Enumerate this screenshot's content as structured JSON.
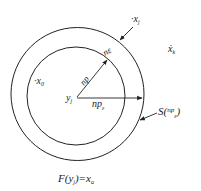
{
  "diagram": {
    "stroke_color": "#222222",
    "background": "#ffffff",
    "center": {
      "x": 77,
      "y": 96
    },
    "outer_circle": {
      "r": 66
    },
    "inner_circle": {
      "r": 49
    },
    "labels": {
      "x0": {
        "dot": "·",
        "base": "x",
        "sub": "0"
      },
      "xj": {
        "dot": "·",
        "base": "x",
        "sub": "j"
      },
      "xk": {
        "base": "ẋ",
        "sub": "k"
      },
      "yj": {
        "base": "y",
        "sub": "j"
      },
      "np": "np",
      "ne": "nε",
      "npe": {
        "base": "np",
        "sub": "ε"
      },
      "S": {
        "prefix": "S(",
        "sup": "np",
        "sub": "ε",
        "suffix": ")"
      },
      "F": {
        "prefix": "F(y",
        "sub": "j",
        "mid": ")=x",
        "sub2": "a"
      }
    }
  }
}
